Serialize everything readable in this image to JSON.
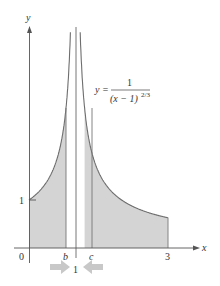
{
  "figure": {
    "axes": {
      "x_label": "x",
      "y_label": "y",
      "origin_label": "0",
      "y_tick_label": "1",
      "x_ticks": [
        {
          "label": "b",
          "value": 0.8,
          "italic": true
        },
        {
          "label": "c",
          "value": 1.2,
          "italic": true
        },
        {
          "label": "3",
          "value": 3,
          "italic": false
        }
      ],
      "asymptote_label": "1"
    },
    "equation": {
      "lhs": "y =",
      "numerator": "1",
      "denominator": "(x − 1)",
      "exponent": "2/3"
    },
    "colors": {
      "shade": "#d4d4d4",
      "curve": "#6e6e6e",
      "axis": "#555555",
      "arrow": "#c8c8c8"
    }
  },
  "chart_data": {
    "type": "area",
    "title": "",
    "function": "y = 1/(x-1)^(2/3)",
    "xlabel": "x",
    "ylabel": "y",
    "xlim": [
      0,
      3.6
    ],
    "ylim": [
      0,
      4.6
    ],
    "vertical_asymptote": 1,
    "shaded_regions": [
      {
        "from": 0,
        "to": "b",
        "approx_to": 0.8
      },
      {
        "from": "c",
        "approx_from": 1.2,
        "to": 3
      }
    ],
    "x_tick_labels": [
      "0",
      "b",
      "1",
      "c",
      "3"
    ],
    "y_tick_labels": [
      "1"
    ],
    "sample_points": [
      {
        "x": 0,
        "y": 1
      },
      {
        "x": 0.5,
        "y": 1.59
      },
      {
        "x": 0.8,
        "y": 2.92
      },
      {
        "x": 1.2,
        "y": 2.92
      },
      {
        "x": 1.5,
        "y": 1.59
      },
      {
        "x": 2,
        "y": 1
      },
      {
        "x": 3,
        "y": 0.63
      }
    ],
    "grid": false,
    "legend": null
  }
}
